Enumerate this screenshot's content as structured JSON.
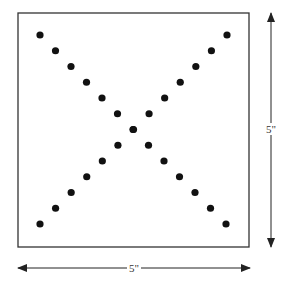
{
  "diagram": {
    "type": "dot-grid-square",
    "square": {
      "x": 18,
      "y": 13,
      "width": 231,
      "height": 234,
      "stroke": "#333333"
    },
    "dots": {
      "count": 25,
      "per_diagonal": 13,
      "radius": 3.6,
      "color": "#111111",
      "diagonal_start": {
        "top_left": [
          40,
          35
        ],
        "top_right": [
          227,
          35
        ]
      },
      "diagonal_end": {
        "bottom_right": [
          226,
          224
        ],
        "bottom_left": [
          40,
          224
        ]
      }
    },
    "dimensions": {
      "width_label": "5\"",
      "height_label": "5\""
    },
    "arrows": {
      "horizontal": {
        "y": 268,
        "x1": 18,
        "x2": 250
      },
      "vertical": {
        "x": 271,
        "y1": 13,
        "y2": 247
      }
    }
  }
}
